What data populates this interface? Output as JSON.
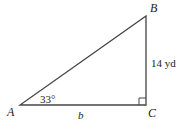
{
  "diagram": {
    "type": "right-triangle",
    "vertices": {
      "A": {
        "label": "A"
      },
      "B": {
        "label": "B"
      },
      "C": {
        "label": "C"
      }
    },
    "angle_A": "33°",
    "side_BC": "14 yd",
    "side_AC": "b",
    "right_angle_at": "C",
    "line_color": "#444444"
  }
}
